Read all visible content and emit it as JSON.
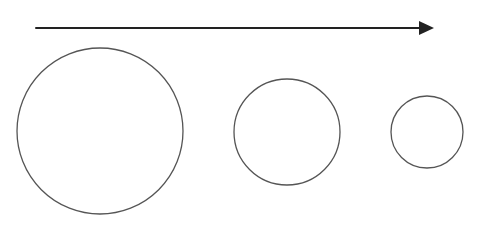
{
  "diagram": {
    "colors": {
      "background": "#ffffff",
      "arrow": "#222222",
      "circle_stroke": "#555555"
    },
    "arrow": {
      "direction": "right",
      "x1": 36,
      "y1": 28,
      "x2": 434,
      "y2": 28,
      "stroke_width": 2
    },
    "circles": [
      {
        "name": "large",
        "cx": 100,
        "cy": 131,
        "r": 83
      },
      {
        "name": "medium",
        "cx": 287,
        "cy": 132,
        "r": 53
      },
      {
        "name": "small",
        "cx": 427,
        "cy": 132,
        "r": 36
      }
    ]
  }
}
